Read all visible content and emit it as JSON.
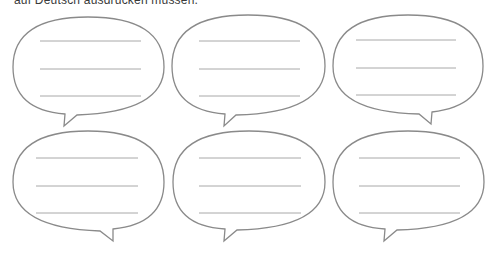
{
  "header": {
    "text": "auf Deutsch ausdrücken müssen."
  },
  "colors": {
    "outline": "#8a8a8a",
    "lines": "#a8a8a8",
    "background": "#ffffff"
  },
  "bubbles": [
    {
      "id": 1,
      "row": 1,
      "col": 1,
      "lines": 3,
      "tail": "bottom-left"
    },
    {
      "id": 2,
      "row": 1,
      "col": 2,
      "lines": 3,
      "tail": "bottom-left"
    },
    {
      "id": 3,
      "row": 1,
      "col": 3,
      "lines": 3,
      "tail": "bottom-right"
    },
    {
      "id": 4,
      "row": 2,
      "col": 1,
      "lines": 3,
      "tail": "bottom-right"
    },
    {
      "id": 5,
      "row": 2,
      "col": 2,
      "lines": 3,
      "tail": "bottom-left"
    },
    {
      "id": 6,
      "row": 2,
      "col": 3,
      "lines": 3,
      "tail": "bottom-left"
    }
  ]
}
